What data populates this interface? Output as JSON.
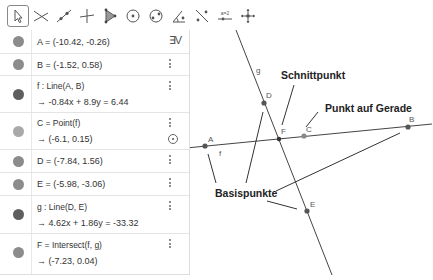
{
  "toolbar": {
    "tools": [
      {
        "name": "move-tool",
        "selected": true
      },
      {
        "name": "point-tool"
      },
      {
        "name": "line-tool"
      },
      {
        "name": "perpendicular-tool"
      },
      {
        "name": "polygon-tool"
      },
      {
        "name": "circle-tool"
      },
      {
        "name": "conic-tool"
      },
      {
        "name": "angle-tool"
      },
      {
        "name": "reflect-tool"
      },
      {
        "name": "slider-tool",
        "label": "a=2"
      },
      {
        "name": "move-view-tool"
      }
    ]
  },
  "algebra": {
    "sort_icon": "∃V",
    "rows": [
      {
        "id": "A",
        "def": "A = (-10.42, -0.26)"
      },
      {
        "id": "B",
        "def": "B = (-1.52, 0.58)"
      },
      {
        "id": "f",
        "def": "f : Line(A, B)",
        "value": "→  -0.84x + 8.9y = 6.44"
      },
      {
        "id": "C",
        "def": "C = Point(f)",
        "value": "→  (-6.1, 0.15)"
      },
      {
        "id": "D",
        "def": "D = (-7.84, 1.56)"
      },
      {
        "id": "E",
        "def": "E = (-5.98, -3.06)"
      },
      {
        "id": "g",
        "def": "g : Line(D, E)",
        "value": "→  4.62x + 1.86y = -33.32"
      },
      {
        "id": "F",
        "def": "F = Intersect(f, g)",
        "value": "→  (-7.23, 0.04)"
      }
    ]
  },
  "graphics": {
    "points": {
      "A": "A",
      "B": "B",
      "C": "C",
      "D": "D",
      "E": "E",
      "F": "F"
    },
    "lines": {
      "f": "f",
      "g": "g"
    },
    "callouts": {
      "intersection": "Schnittpunkt",
      "point_on_line": "Punkt auf Gerade",
      "base_points": "Basispunkte"
    }
  }
}
